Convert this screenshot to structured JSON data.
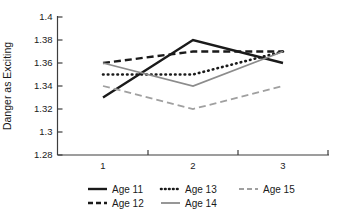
{
  "chart_data": {
    "type": "line",
    "title": "",
    "xlabel": "",
    "ylabel": "Danger as Exciting",
    "ylim": [
      1.28,
      1.4
    ],
    "y_tick_labels": [
      "1.4",
      "1.38",
      "1.36",
      "1.34",
      "1.32",
      "1.3",
      "1.28"
    ],
    "x_tick_labels": [
      "1",
      "2",
      "3"
    ],
    "categories": [
      1,
      2,
      3
    ],
    "grid": false,
    "legend_position": "bottom",
    "series": [
      {
        "name": "Age 11",
        "values": [
          1.33,
          1.38,
          1.36
        ],
        "color": "#1a1a1a",
        "style": "solid",
        "width": 2.4
      },
      {
        "name": "Age 12",
        "values": [
          1.36,
          1.37,
          1.37
        ],
        "color": "#1a1a1a",
        "style": "dashed",
        "width": 2.4
      },
      {
        "name": "Age 13",
        "values": [
          1.35,
          1.35,
          1.37
        ],
        "color": "#1a1a1a",
        "style": "dotted",
        "width": 2.6
      },
      {
        "name": "Age 14",
        "values": [
          1.36,
          1.34,
          1.37
        ],
        "color": "#8c8c8c",
        "style": "solid",
        "width": 1.8
      },
      {
        "name": "Age 15",
        "values": [
          1.34,
          1.32,
          1.34
        ],
        "color": "#a0a0a0",
        "style": "dashed",
        "width": 1.8
      }
    ],
    "axis_color": "#3d3d3d"
  }
}
